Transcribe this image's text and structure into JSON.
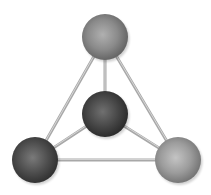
{
  "diagram": {
    "type": "tetrahedral-molecule",
    "width": 211,
    "height": 195,
    "background": "#ffffff",
    "atoms": [
      {
        "id": "top",
        "cx": 105,
        "cy": 37,
        "r": 23,
        "light": "#b0b0b0",
        "mid": "#8a8a8a",
        "dark": "#5e5e5e"
      },
      {
        "id": "center",
        "cx": 105,
        "cy": 114,
        "r": 23,
        "light": "#707070",
        "mid": "#474747",
        "dark": "#262626"
      },
      {
        "id": "bottom-left",
        "cx": 35,
        "cy": 160,
        "r": 23,
        "light": "#7a7a7a",
        "mid": "#4e4e4e",
        "dark": "#2c2c2c"
      },
      {
        "id": "bottom-right",
        "cx": 178,
        "cy": 160,
        "r": 23,
        "light": "#c4c4c4",
        "mid": "#9c9c9c",
        "dark": "#6e6e6e"
      }
    ],
    "bonds": [
      {
        "from": "top",
        "to": "center"
      },
      {
        "from": "top",
        "to": "bottom-left"
      },
      {
        "from": "top",
        "to": "bottom-right"
      },
      {
        "from": "center",
        "to": "bottom-left"
      },
      {
        "from": "center",
        "to": "bottom-right"
      },
      {
        "from": "bottom-left",
        "to": "bottom-right"
      }
    ],
    "bond_color": "#a8a8a8",
    "bond_highlight": "#d6d6d6",
    "bond_width": 3
  }
}
